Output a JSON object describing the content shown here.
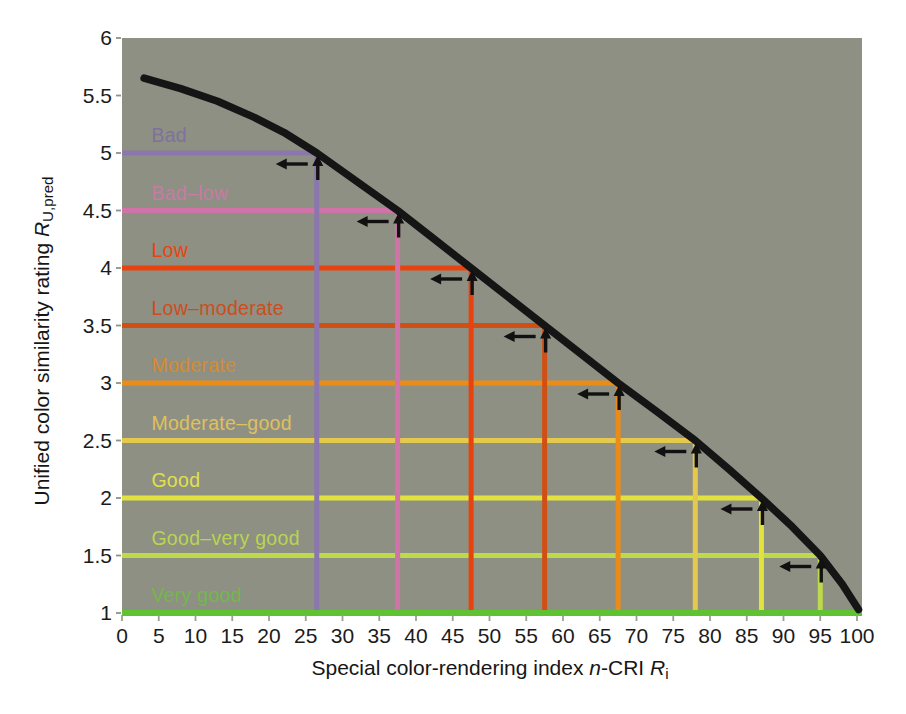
{
  "figure": {
    "background": "#ffffff",
    "plot_background": "#8e9083",
    "curve_color": "#151515",
    "arrow_color": "#111111",
    "tick_color": "#9aa091",
    "y_tick_color": "#8f9287"
  },
  "x_axis": {
    "title_prefix": "Special color-rendering index ",
    "title_var1": "n",
    "title_mid": "-CRI ",
    "title_var2": "R",
    "title_sub": "i",
    "tick_labels": [
      "0",
      "5",
      "10",
      "15",
      "20",
      "25",
      "30",
      "35",
      "40",
      "45",
      "50",
      "55",
      "60",
      "65",
      "70",
      "75",
      "80",
      "85",
      "90",
      "95",
      "100"
    ],
    "tick_values": [
      0,
      5,
      10,
      15,
      20,
      25,
      30,
      35,
      40,
      45,
      50,
      55,
      60,
      65,
      70,
      75,
      80,
      85,
      90,
      95,
      100
    ]
  },
  "y_axis": {
    "title_prefix": "Unified color similarity rating ",
    "title_var": "R",
    "title_sub": "U,pred",
    "tick_labels": [
      "6",
      "5.5",
      "5",
      "4.5",
      "4",
      "3.5",
      "3",
      "2.5",
      "2",
      "1.5",
      "1"
    ],
    "tick_values": [
      6,
      5.5,
      5,
      4.5,
      4,
      3.5,
      3,
      2.5,
      2,
      1.5,
      1
    ]
  },
  "chart_data": {
    "type": "line",
    "title": "",
    "xlabel": "Special color-rendering index n-CRI Ri",
    "ylabel": "Unified color similarity rating RU,pred",
    "xlim": [
      0,
      100
    ],
    "ylim": [
      1,
      6
    ],
    "grid": false,
    "legend": "none",
    "curve": {
      "name": "predicted-rating-curve",
      "color": "#151515",
      "points": [
        [
          3,
          5.65
        ],
        [
          8,
          5.56
        ],
        [
          13,
          5.45
        ],
        [
          18,
          5.31
        ],
        [
          22,
          5.18
        ],
        [
          26.5,
          5.0
        ],
        [
          32,
          4.75
        ],
        [
          37.5,
          4.5
        ],
        [
          42.5,
          4.25
        ],
        [
          47.5,
          4.0
        ],
        [
          52.5,
          3.75
        ],
        [
          57.5,
          3.5
        ],
        [
          62.5,
          3.25
        ],
        [
          67.5,
          3.0
        ],
        [
          72.8,
          2.75
        ],
        [
          78,
          2.5
        ],
        [
          82.6,
          2.25
        ],
        [
          87,
          2.0
        ],
        [
          91.2,
          1.75
        ],
        [
          95,
          1.5
        ],
        [
          98,
          1.25
        ],
        [
          100.2,
          1.03
        ]
      ]
    },
    "categories": [
      {
        "label": "Bad",
        "rating": 5,
        "cri": 26.5,
        "color": "#8a77ad",
        "label_color": "#80709e",
        "arrows": true
      },
      {
        "label": "Bad–low",
        "rating": 4.5,
        "cri": 37.5,
        "color": "#cf74a8",
        "label_color": "#c77ba6",
        "arrows": true
      },
      {
        "label": "Low",
        "rating": 4,
        "cri": 47.5,
        "color": "#e8430f",
        "label_color": "#e5450f",
        "arrows": true
      },
      {
        "label": "Low–moderate",
        "rating": 3.5,
        "cri": 57.5,
        "color": "#d04f15",
        "label_color": "#cc4d1c",
        "arrows": true
      },
      {
        "label": "Moderate",
        "rating": 3,
        "cri": 67.5,
        "color": "#ec8c18",
        "label_color": "#d98a2c",
        "arrows": true
      },
      {
        "label": "Moderate–good",
        "rating": 2.5,
        "cri": 78,
        "color": "#e5c84e",
        "label_color": "#e0c05c",
        "arrows": true
      },
      {
        "label": "Good",
        "rating": 2,
        "cri": 87,
        "color": "#e2e23f",
        "label_color": "#e0e04a",
        "arrows": true
      },
      {
        "label": "Good–very good",
        "rating": 1.5,
        "cri": 95,
        "color": "#bcda4a",
        "label_color": "#b8d552",
        "arrows": true
      },
      {
        "label": "Very good",
        "rating": 1,
        "cri": null,
        "color": "#5ec232",
        "label_color": "#72b84a",
        "arrows": false
      }
    ]
  }
}
